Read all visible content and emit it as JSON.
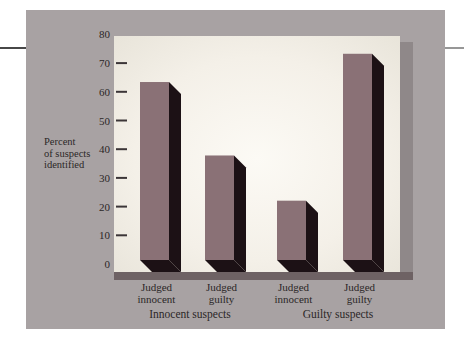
{
  "figure": {
    "ylabel": "Percent\nof suspects\nidentified"
  },
  "chart_data": {
    "type": "bar",
    "title": "",
    "xlabel": "",
    "ylabel": "Percent of suspects identified",
    "ylim": [
      0,
      80
    ],
    "yticks": [
      0,
      10,
      20,
      30,
      40,
      50,
      60,
      70,
      80
    ],
    "grid": false,
    "legend": false,
    "style": "3d-extruded-bars",
    "categories": [
      "Judged\ninnocent",
      "Judged\nguilty",
      "Judged\ninnocent",
      "Judged\nguilty"
    ],
    "group_labels": [
      "Innocent suspects",
      "Guilty suspects"
    ],
    "groups": [
      {
        "label": "Innocent suspects",
        "bars": [
          {
            "category": "Judged innocent",
            "value": 63
          },
          {
            "category": "Judged guilty",
            "value": 37
          }
        ]
      },
      {
        "label": "Guilty suspects",
        "bars": [
          {
            "category": "Judged innocent",
            "value": 21
          },
          {
            "category": "Judged guilty",
            "value": 73
          }
        ]
      }
    ],
    "values": [
      63,
      37,
      21,
      73
    ]
  },
  "colors": {
    "page_bg": "#ffffff",
    "panel_bg": "#a8a2a3",
    "plot_center": "#fcfaf5",
    "plot_mid": "#f4f0e8",
    "plot_edge": "#e6e2d7",
    "plot_shadow": "#8f8889",
    "axis_floor": "#6e6264",
    "bar_front": "#8a7176",
    "bar_dark": "#1c1115",
    "text": "#2b2727",
    "tick": "#3b3537",
    "rule_left": "#474747",
    "rule_right": "#979797"
  }
}
